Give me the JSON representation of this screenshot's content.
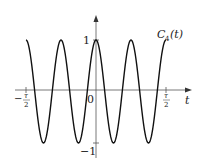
{
  "chart_data": {
    "type": "line",
    "title": "",
    "series": [
      {
        "name": "C_4(t)",
        "function": "cos(8*pi*t/tau)",
        "description": "4 full periods over [-tau/2, tau/2], amplitude 1"
      }
    ],
    "xlabel": "t",
    "ylabel": "",
    "xlim": [
      "-tau/2",
      "tau/2"
    ],
    "ylim": [
      -1,
      1
    ],
    "x_ticks": [
      "-τ/2",
      "0",
      "τ/2"
    ],
    "y_ticks": [
      "1",
      "-1"
    ],
    "grid": false,
    "legend": "inline label near right end"
  },
  "labels": {
    "curve": "C",
    "curve_sub": "4",
    "curve_arg": "(t)",
    "x_axis": "t",
    "y_one": "1",
    "y_neg_one": "−1",
    "origin": "0",
    "x_left_minus": "−",
    "tau": "τ",
    "two": "2"
  }
}
